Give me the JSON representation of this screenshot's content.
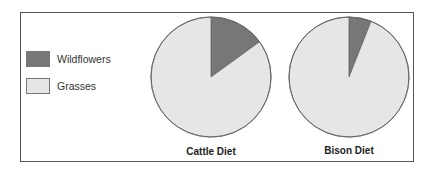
{
  "legend": {
    "items": [
      {
        "label": "Wildflowers",
        "color": "#777777"
      },
      {
        "label": "Grasses",
        "color": "#e6e6e6"
      }
    ]
  },
  "charts": [
    {
      "title": "Cattle Diet"
    },
    {
      "title": "Bison Diet"
    }
  ],
  "chart_data": [
    {
      "type": "pie",
      "title": "Cattle Diet",
      "categories": [
        "Wildflowers",
        "Grasses"
      ],
      "values": [
        15,
        85
      ],
      "colors": [
        "#777777",
        "#e6e6e6"
      ],
      "start_angle": "12 o'clock, clockwise",
      "legend_position": "left"
    },
    {
      "type": "pie",
      "title": "Bison Diet",
      "categories": [
        "Wildflowers",
        "Grasses"
      ],
      "values": [
        6,
        94
      ],
      "colors": [
        "#777777",
        "#e6e6e6"
      ],
      "start_angle": "12 o'clock, clockwise",
      "legend_position": "left"
    }
  ]
}
